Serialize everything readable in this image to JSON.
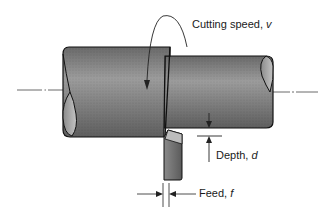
{
  "diagram": {
    "labels": {
      "cutting_speed": {
        "text": "Cutting speed, ",
        "var": "v"
      },
      "depth": {
        "text": "Depth, ",
        "var": "d"
      },
      "feed": {
        "text": "Feed, ",
        "var": "f"
      }
    },
    "colors": {
      "workpiece_fill": "#7a7a7a",
      "workpiece_highlight": "#a0a0a0",
      "outline": "#111111",
      "tool_fill": "#6e6e6e",
      "tool_face": "#b8b8b8",
      "centerline": "#444444",
      "background": "#ffffff"
    },
    "elements": [
      "workpiece-large-diameter",
      "workpiece-reduced-diameter",
      "cutting-tool",
      "centerline",
      "rotation-arrow",
      "depth-dimension",
      "feed-dimension"
    ]
  }
}
